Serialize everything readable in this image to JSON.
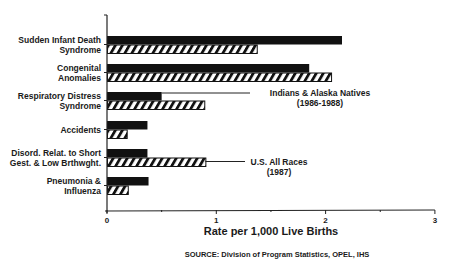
{
  "chart_data": {
    "type": "bar",
    "orientation": "horizontal",
    "title": "",
    "xlabel": "Rate per 1,000 Live Births",
    "ylabel": "",
    "xlim": [
      0,
      3
    ],
    "x_ticks": [
      "0",
      "1",
      "2",
      "3"
    ],
    "grid": false,
    "categories": [
      [
        "Sudden Infant Death",
        "Syndrome"
      ],
      [
        "Congenital",
        "Anomalies"
      ],
      [
        "Respiratory Distress",
        "Syndrome"
      ],
      [
        "Accidents"
      ],
      [
        "Disord. Relat. to Short",
        "Gest. & Low Brthwght."
      ],
      [
        "Pneumonia &",
        "Influenza"
      ]
    ],
    "series": [
      {
        "name": "Indians & Alaska Natives (1986-1988)",
        "style": "solid",
        "color": "#111111",
        "values": [
          2.15,
          1.85,
          0.5,
          0.37,
          0.37,
          0.38
        ]
      },
      {
        "name": "U.S. All Races (1987)",
        "style": "hatched",
        "color": "#111111",
        "values": [
          1.37,
          2.05,
          0.89,
          0.18,
          0.9,
          0.19
        ]
      }
    ],
    "annotations": [
      {
        "text": [
          "Indians & Alaska Natives",
          "(1986-1988)"
        ],
        "points_to": "Respiratory Distress Syndrome solid bar"
      },
      {
        "text": [
          "U.S. All Races",
          "(1987)"
        ],
        "points_to": "Disord. Relat. to Short Gest. hatched bar"
      }
    ],
    "legend_position": "inline annotations"
  },
  "source": "SOURCE:  Division of Program Statistics,  OPEL,  IHS"
}
